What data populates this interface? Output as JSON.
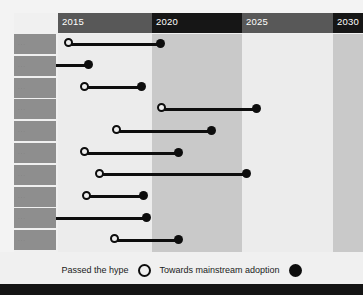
{
  "chart_data": {
    "type": "bar",
    "chart_style": "dumbbell-timeline",
    "title": "",
    "xlabel": "",
    "ylabel": "",
    "xlim": [
      2013.0,
      2031.5
    ],
    "grid": false,
    "legend_position": "bottom-center",
    "axis_years": [
      {
        "label": "2015",
        "value": 2015,
        "x_px": 58,
        "width_px": 94,
        "shade": "light"
      },
      {
        "label": "2020",
        "value": 2020,
        "x_px": 152,
        "width_px": 90,
        "shade": "dark"
      },
      {
        "label": "2025",
        "value": 2025,
        "x_px": 242,
        "width_px": 91,
        "shade": "light"
      },
      {
        "label": "2030",
        "value": 2030,
        "x_px": 333,
        "width_px": 30,
        "shade": "dark"
      }
    ],
    "legend": [
      {
        "name": "Passed the hype",
        "marker": "open-circle"
      },
      {
        "name": "Towards mainstream adoption",
        "marker": "filled-circle"
      }
    ],
    "categories": [
      "...",
      "...",
      "...",
      "...",
      "...",
      "...",
      "...",
      "...",
      "...",
      "..."
    ],
    "series": [
      {
        "name": "Passed the hype",
        "marker": "open-circle",
        "values": [
          2015.7,
          null,
          2016.6,
          2020.5,
          2018.2,
          2016.5,
          2017.3,
          2016.7,
          null,
          2018.1
        ]
      },
      {
        "name": "Towards mainstream adoption",
        "marker": "filled-circle",
        "values": [
          2020.6,
          2016.7,
          2019.5,
          2025.6,
          2023.1,
          2021.5,
          2025.4,
          2019.6,
          2019.7,
          2021.5
        ]
      }
    ],
    "rows": [
      {
        "label": "...",
        "start_px": 68,
        "end_px": 160,
        "start_open": true,
        "clipped_left": false
      },
      {
        "label": "...",
        "start_px": 56,
        "end_px": 88,
        "start_open": false,
        "clipped_left": true
      },
      {
        "label": "...",
        "start_px": 84,
        "end_px": 141,
        "start_open": true,
        "clipped_left": false
      },
      {
        "label": "...",
        "start_px": 161,
        "end_px": 256,
        "start_open": true,
        "clipped_left": false
      },
      {
        "label": "...",
        "start_px": 116,
        "end_px": 211,
        "start_open": true,
        "clipped_left": false
      },
      {
        "label": "...",
        "start_px": 84,
        "end_px": 178,
        "start_open": true,
        "clipped_left": false
      },
      {
        "label": "...",
        "start_px": 99,
        "end_px": 246,
        "start_open": true,
        "clipped_left": false
      },
      {
        "label": "...",
        "start_px": 86,
        "end_px": 143,
        "start_open": true,
        "clipped_left": false
      },
      {
        "label": "...",
        "start_px": 56,
        "end_px": 146,
        "start_open": false,
        "clipped_left": true
      },
      {
        "label": "...",
        "start_px": 114,
        "end_px": 178,
        "start_open": true,
        "clipped_left": false
      }
    ],
    "row_geometry": {
      "top_px": 34,
      "height_px": 20,
      "gap_px": 1.8
    }
  },
  "colors": {
    "page_background": "#f0f0f0",
    "header_band_light": "#585858",
    "header_band_dark": "#161616",
    "column_band_light": "#ececec",
    "column_band_dark": "#c9c9c9",
    "row_label_cell": "#8e8e8e",
    "mark": "#0d0d0d",
    "header_text": "#ffffff",
    "legend_text": "#1b1b1b",
    "footer_bar": "#141414"
  },
  "footer": {
    "caption": ""
  }
}
